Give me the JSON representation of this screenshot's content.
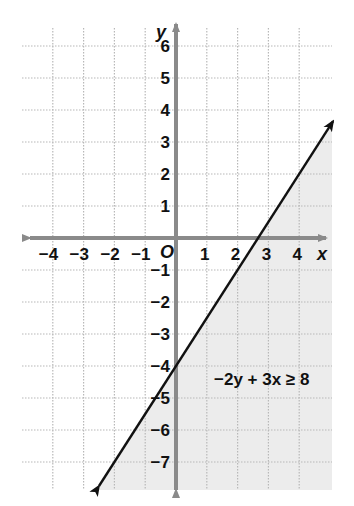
{
  "chart_data": {
    "type": "line",
    "title": "",
    "xlabel": "x",
    "ylabel": "y",
    "origin_label": "O",
    "xlim": [
      -4.5,
      5
    ],
    "ylim": [
      -8,
      6.8
    ],
    "x_ticks": [
      -4,
      -3,
      -2,
      -1,
      1,
      2,
      3,
      4
    ],
    "y_ticks": [
      6,
      5,
      4,
      3,
      2,
      1,
      -1,
      -2,
      -3,
      -4,
      -5,
      -6,
      -7
    ],
    "x_tick_labels": [
      "−4",
      "−3",
      "−2",
      "−1",
      "1",
      "2",
      "3",
      "4"
    ],
    "y_tick_labels": [
      "6",
      "5",
      "4",
      "3",
      "2",
      "1",
      "−1",
      "−2",
      "−3",
      "−4",
      "−5",
      "−6",
      "−7"
    ],
    "grid": true,
    "series": [
      {
        "name": "boundary line",
        "equation": "y = 1.5x - 4",
        "style": "solid",
        "x": [
          -2.5,
          5.1
        ],
        "y": [
          -7.75,
          3.65
        ]
      }
    ],
    "shaded_region": {
      "inequality": "−2y + 3x ≥ 8",
      "side": "below-right of line",
      "color": "#ececec"
    },
    "annotations": [
      {
        "text": "−2y + 3x ≥ 8",
        "x": 1.3,
        "y": -4.4
      }
    ]
  }
}
